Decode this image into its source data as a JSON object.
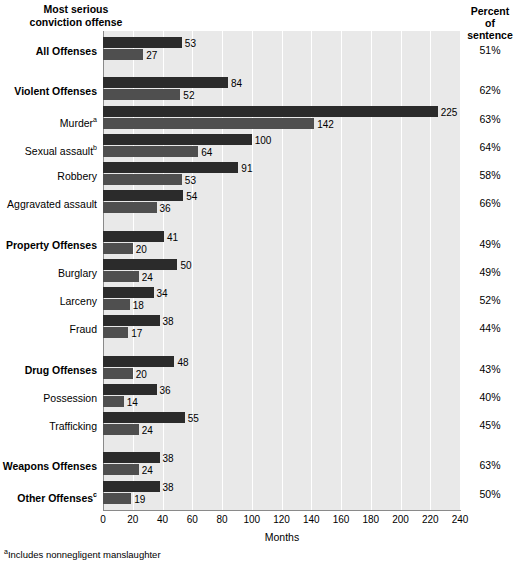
{
  "header": {
    "left_line1": "Most serious",
    "left_line2": "conviction offense",
    "right_line1": "Percent",
    "right_line2": "of",
    "right_line3": "sentence"
  },
  "axis": {
    "xlabel": "Months",
    "ticks": [
      "0",
      "20",
      "40",
      "60",
      "80",
      "100",
      "120",
      "140",
      "160",
      "180",
      "200",
      "220",
      "240"
    ]
  },
  "footnote": {
    "marker": "a",
    "text": "Includes nonnegligent manslaughter"
  },
  "rows": [
    {
      "label": "All Offenses",
      "sup": "",
      "bold": true,
      "top": 53,
      "bottom": 27,
      "top_text": "53",
      "bottom_text": "27",
      "percent": "51%",
      "group_start": false
    },
    {
      "label": "Violent Offenses",
      "sup": "",
      "bold": true,
      "top": 84,
      "bottom": 52,
      "top_text": "84",
      "bottom_text": "52",
      "percent": "62%",
      "group_start": true
    },
    {
      "label": "Murder",
      "sup": "a",
      "bold": false,
      "top": 225,
      "bottom": 142,
      "top_text": "225",
      "bottom_text": "142",
      "percent": "63%",
      "group_start": false
    },
    {
      "label": "Sexual assault",
      "sup": "b",
      "bold": false,
      "top": 100,
      "bottom": 64,
      "top_text": "100",
      "bottom_text": "64",
      "percent": "64%",
      "group_start": false
    },
    {
      "label": "Robbery",
      "sup": "",
      "bold": false,
      "top": 91,
      "bottom": 53,
      "top_text": "91",
      "bottom_text": "53",
      "percent": "58%",
      "group_start": false
    },
    {
      "label": "Aggravated assault",
      "sup": "",
      "bold": false,
      "top": 54,
      "bottom": 36,
      "top_text": "54",
      "bottom_text": "36",
      "percent": "66%",
      "group_start": false
    },
    {
      "label": "Property Offenses",
      "sup": "",
      "bold": true,
      "top": 41,
      "bottom": 20,
      "top_text": "41",
      "bottom_text": "20",
      "percent": "49%",
      "group_start": true
    },
    {
      "label": "Burglary",
      "sup": "",
      "bold": false,
      "top": 50,
      "bottom": 24,
      "top_text": "50",
      "bottom_text": "24",
      "percent": "49%",
      "group_start": false
    },
    {
      "label": "Larceny",
      "sup": "",
      "bold": false,
      "top": 34,
      "bottom": 18,
      "top_text": "34",
      "bottom_text": "18",
      "percent": "52%",
      "group_start": false
    },
    {
      "label": "Fraud",
      "sup": "",
      "bold": false,
      "top": 38,
      "bottom": 17,
      "top_text": "38",
      "bottom_text": "17",
      "percent": "44%",
      "group_start": false
    },
    {
      "label": "Drug Offenses",
      "sup": "",
      "bold": true,
      "top": 48,
      "bottom": 20,
      "top_text": "48",
      "bottom_text": "20",
      "percent": "43%",
      "group_start": true
    },
    {
      "label": "Possession",
      "sup": "",
      "bold": false,
      "top": 36,
      "bottom": 14,
      "top_text": "36",
      "bottom_text": "14",
      "percent": "40%",
      "group_start": false
    },
    {
      "label": "Trafficking",
      "sup": "",
      "bold": false,
      "top": 55,
      "bottom": 24,
      "top_text": "55",
      "bottom_text": "24",
      "percent": "45%",
      "group_start": false
    },
    {
      "label": "Weapons Offenses",
      "sup": "",
      "bold": true,
      "top": 38,
      "bottom": 24,
      "top_text": "38",
      "bottom_text": "24",
      "percent": "63%",
      "group_start": true
    },
    {
      "label": "Other Offenses",
      "sup": "c",
      "bold": true,
      "top": 38,
      "bottom": 19,
      "top_text": "38",
      "bottom_text": "19",
      "percent": "50%",
      "group_start": false
    }
  ],
  "chart_data": {
    "type": "bar",
    "orientation": "horizontal",
    "title": "Most serious conviction offense",
    "xlabel": "Months",
    "ylabel": "Most serious conviction offense",
    "xlim": [
      0,
      240
    ],
    "xticks": [
      0,
      20,
      40,
      60,
      80,
      100,
      120,
      140,
      160,
      180,
      200,
      220,
      240
    ],
    "grid": "vertical",
    "legend": "none",
    "categories": [
      "All Offenses",
      "Violent Offenses",
      "Murder",
      "Sexual assault",
      "Robbery",
      "Aggravated assault",
      "Property Offenses",
      "Burglary",
      "Larceny",
      "Fraud",
      "Drug Offenses",
      "Possession",
      "Trafficking",
      "Weapons Offenses",
      "Other Offenses"
    ],
    "series": [
      {
        "name": "Mean sentence length (months)",
        "color": "#2b2b2b",
        "values": [
          53,
          84,
          225,
          100,
          91,
          54,
          41,
          50,
          34,
          38,
          48,
          36,
          55,
          38,
          38
        ]
      },
      {
        "name": "Mean time served (months)",
        "color": "#4f4f4f",
        "values": [
          27,
          52,
          142,
          64,
          53,
          36,
          20,
          24,
          18,
          17,
          20,
          14,
          24,
          24,
          19
        ]
      }
    ],
    "annotations": {
      "percent_of_sentence": [
        "51%",
        "62%",
        "63%",
        "64%",
        "58%",
        "66%",
        "49%",
        "49%",
        "52%",
        "44%",
        "43%",
        "40%",
        "45%",
        "63%",
        "50%"
      ],
      "footnote_a": "Includes nonnegligent manslaughter"
    }
  }
}
